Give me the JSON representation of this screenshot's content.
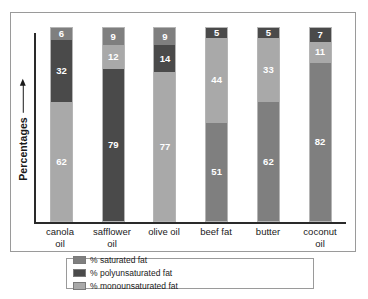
{
  "chart_data": {
    "type": "bar",
    "stacked": true,
    "title": "",
    "xlabel": "",
    "ylabel": "Percentages",
    "ylim": [
      0,
      100
    ],
    "grid": false,
    "legend_position": "bottom",
    "categories": [
      "canola oil",
      "safflower oil",
      "olive oil",
      "beef fat",
      "butter",
      "coconut oil"
    ],
    "series": [
      {
        "name": "% saturated fat",
        "key": "saturated",
        "color": "#7f7f7f",
        "values": [
          6,
          9,
          9,
          51,
          62,
          82
        ]
      },
      {
        "name": "% monounsaturated fat",
        "key": "monounsaturated",
        "color": "#a9a9a9",
        "values": [
          62,
          12,
          77,
          44,
          33,
          11
        ]
      },
      {
        "name": "% polyunsaturated fat",
        "key": "polyunsaturated",
        "color": "#4a4a4a",
        "values": [
          32,
          79,
          14,
          5,
          5,
          7
        ]
      }
    ],
    "bars": [
      {
        "category": "canola oil",
        "label_line1": "canola",
        "label_line2": "oil",
        "segments": [
          {
            "key": "monounsaturated",
            "value": 62,
            "color": "#a9a9a9",
            "label": "62"
          },
          {
            "key": "polyunsaturated",
            "value": 32,
            "color": "#4a4a4a",
            "label": "32"
          },
          {
            "key": "saturated",
            "value": 6,
            "color": "#7f7f7f",
            "label": "6"
          }
        ]
      },
      {
        "category": "safflower oil",
        "label_line1": "safflower",
        "label_line2": "oil",
        "segments": [
          {
            "key": "polyunsaturated",
            "value": 79,
            "color": "#4a4a4a",
            "label": "79"
          },
          {
            "key": "monounsaturated",
            "value": 12,
            "color": "#a9a9a9",
            "label": "12"
          },
          {
            "key": "saturated",
            "value": 9,
            "color": "#7f7f7f",
            "label": "9"
          }
        ]
      },
      {
        "category": "olive oil",
        "label_line1": "olive oil",
        "label_line2": "",
        "segments": [
          {
            "key": "monounsaturated",
            "value": 77,
            "color": "#a9a9a9",
            "label": "77"
          },
          {
            "key": "polyunsaturated",
            "value": 14,
            "color": "#4a4a4a",
            "label": "14"
          },
          {
            "key": "saturated",
            "value": 9,
            "color": "#7f7f7f",
            "label": "9"
          }
        ]
      },
      {
        "category": "beef fat",
        "label_line1": "beef fat",
        "label_line2": "",
        "segments": [
          {
            "key": "saturated",
            "value": 51,
            "color": "#7f7f7f",
            "label": "51"
          },
          {
            "key": "monounsaturated",
            "value": 44,
            "color": "#a9a9a9",
            "label": "44"
          },
          {
            "key": "polyunsaturated",
            "value": 5,
            "color": "#4a4a4a",
            "label": "5"
          }
        ]
      },
      {
        "category": "butter",
        "label_line1": "butter",
        "label_line2": "",
        "segments": [
          {
            "key": "saturated",
            "value": 62,
            "color": "#7f7f7f",
            "label": "62"
          },
          {
            "key": "monounsaturated",
            "value": 33,
            "color": "#a9a9a9",
            "label": "33"
          },
          {
            "key": "polyunsaturated",
            "value": 5,
            "color": "#4a4a4a",
            "label": "5"
          }
        ]
      },
      {
        "category": "coconut oil",
        "label_line1": "coconut",
        "label_line2": "oil",
        "segments": [
          {
            "key": "saturated",
            "value": 82,
            "color": "#7f7f7f",
            "label": "82"
          },
          {
            "key": "monounsaturated",
            "value": 11,
            "color": "#a9a9a9",
            "label": "11"
          },
          {
            "key": "polyunsaturated",
            "value": 7,
            "color": "#4a4a4a",
            "label": "7"
          }
        ]
      }
    ],
    "legend": [
      {
        "label": "% saturated fat",
        "color": "#7f7f7f"
      },
      {
        "label": "% polyunsaturated fat",
        "color": "#4a4a4a"
      },
      {
        "label": "% monounsaturated fat",
        "color": "#a9a9a9"
      }
    ]
  }
}
